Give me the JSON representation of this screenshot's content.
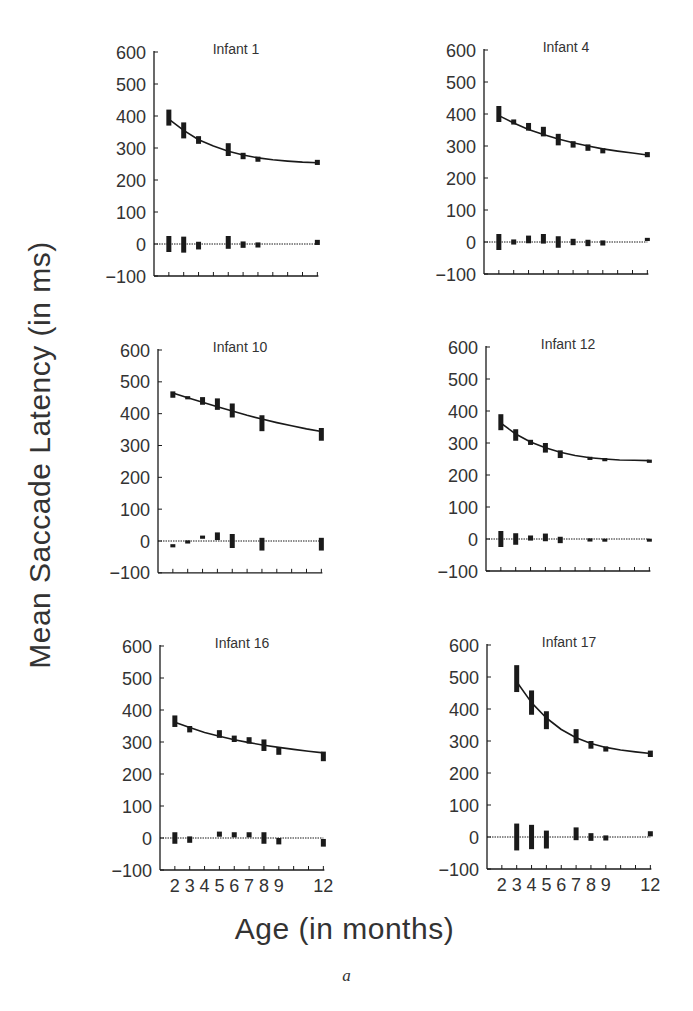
{
  "figure": {
    "ylabel": "Mean Saccade Latency (in ms)",
    "xlabel": "Age (in months)",
    "caption": "a"
  },
  "chart_data": [
    {
      "type": "line",
      "title": "Infant 1",
      "xlabel": "Age (in months)",
      "ylabel": "Mean Saccade Latency (in ms)",
      "ylim": [
        -100,
        600
      ],
      "yticks": [
        -100,
        0,
        100,
        200,
        300,
        400,
        500,
        600
      ],
      "xlim": [
        1,
        12
      ],
      "xticks": [
        2,
        3,
        4,
        5,
        6,
        7,
        8,
        9,
        10,
        11,
        12
      ],
      "xtick_labels_shown": false,
      "series": [
        {
          "name": "Observed mean latency (error bars)",
          "x": [
            2,
            3,
            4,
            6,
            7,
            8,
            12
          ],
          "values": [
            395,
            355,
            325,
            295,
            275,
            265,
            255
          ],
          "err": [
            25,
            25,
            12,
            20,
            10,
            8,
            8
          ]
        },
        {
          "name": "Fitted curve",
          "x": [
            2,
            3,
            4,
            5,
            6,
            7,
            8,
            9,
            10,
            11,
            12
          ],
          "values": [
            390,
            355,
            326,
            306,
            290,
            278,
            269,
            263,
            259,
            256,
            254
          ]
        },
        {
          "name": "Residuals",
          "x": [
            2,
            3,
            4,
            6,
            7,
            8,
            12
          ],
          "values": [
            0,
            -2,
            -5,
            5,
            -2,
            -3,
            5
          ],
          "err": [
            25,
            25,
            12,
            20,
            10,
            8,
            8
          ]
        }
      ]
    },
    {
      "type": "line",
      "title": "Infant 4",
      "xlabel": "Age (in months)",
      "ylabel": "Mean Saccade Latency (in ms)",
      "ylim": [
        -100,
        600
      ],
      "yticks": [
        -100,
        0,
        100,
        200,
        300,
        400,
        500,
        600
      ],
      "xlim": [
        1,
        12
      ],
      "xticks": [
        2,
        3,
        4,
        5,
        6,
        7,
        8,
        9,
        10,
        11,
        12
      ],
      "xtick_labels_shown": false,
      "series": [
        {
          "name": "Observed mean latency (error bars)",
          "x": [
            2,
            3,
            4,
            5,
            6,
            7,
            8,
            9,
            12
          ],
          "values": [
            400,
            375,
            360,
            345,
            320,
            305,
            295,
            285,
            273
          ],
          "err": [
            25,
            8,
            12,
            15,
            18,
            10,
            10,
            8,
            8
          ]
        },
        {
          "name": "Fitted curve",
          "x": [
            2,
            3,
            4,
            5,
            6,
            7,
            8,
            9,
            10,
            11,
            12
          ],
          "values": [
            395,
            372,
            352,
            336,
            322,
            310,
            300,
            291,
            284,
            278,
            272
          ]
        },
        {
          "name": "Residuals",
          "x": [
            2,
            3,
            4,
            5,
            6,
            7,
            8,
            9,
            12
          ],
          "values": [
            0,
            0,
            8,
            10,
            0,
            0,
            -3,
            -3,
            8
          ],
          "err": [
            25,
            8,
            12,
            15,
            18,
            10,
            10,
            8,
            5
          ]
        }
      ]
    },
    {
      "type": "line",
      "title": "Infant 10",
      "xlabel": "Age (in months)",
      "ylabel": "Mean Saccade Latency (in ms)",
      "ylim": [
        -100,
        600
      ],
      "yticks": [
        -100,
        0,
        100,
        200,
        300,
        400,
        500,
        600
      ],
      "xlim": [
        1,
        12
      ],
      "xticks": [
        2,
        3,
        4,
        5,
        6,
        7,
        8,
        9,
        10,
        11,
        12
      ],
      "xtick_labels_shown": false,
      "series": [
        {
          "name": "Observed mean latency (error bars)",
          "x": [
            2,
            3,
            4,
            5,
            6,
            8,
            12
          ],
          "values": [
            460,
            450,
            440,
            430,
            410,
            370,
            335
          ],
          "err": [
            10,
            5,
            12,
            18,
            22,
            25,
            20
          ]
        },
        {
          "name": "Fitted curve",
          "x": [
            2,
            3,
            4,
            5,
            6,
            7,
            8,
            9,
            10,
            11,
            12
          ],
          "values": [
            465,
            450,
            436,
            422,
            408,
            395,
            383,
            372,
            362,
            352,
            344
          ]
        },
        {
          "name": "Residuals",
          "x": [
            2,
            3,
            4,
            5,
            6,
            8,
            12
          ],
          "values": [
            -15,
            -3,
            12,
            15,
            0,
            -10,
            -10
          ],
          "err": [
            5,
            5,
            5,
            12,
            22,
            20,
            20
          ]
        }
      ]
    },
    {
      "type": "line",
      "title": "Infant 12",
      "xlabel": "Age (in months)",
      "ylabel": "Mean Saccade Latency (in ms)",
      "ylim": [
        -100,
        600
      ],
      "yticks": [
        -100,
        0,
        100,
        200,
        300,
        400,
        500,
        600
      ],
      "xlim": [
        1,
        12
      ],
      "xticks": [
        2,
        3,
        4,
        5,
        6,
        7,
        8,
        9,
        10,
        11,
        12
      ],
      "xtick_labels_shown": false,
      "series": [
        {
          "name": "Observed mean latency (error bars)",
          "x": [
            2,
            3,
            4,
            5,
            6,
            8,
            9,
            12
          ],
          "values": [
            365,
            325,
            302,
            285,
            265,
            252,
            248,
            243
          ],
          "err": [
            25,
            18,
            8,
            15,
            12,
            5,
            5,
            5
          ]
        },
        {
          "name": "Fitted curve",
          "x": [
            2,
            3,
            4,
            5,
            6,
            7,
            8,
            9,
            10,
            11,
            12
          ],
          "values": [
            362,
            328,
            303,
            285,
            271,
            261,
            254,
            250,
            247,
            246,
            245
          ]
        },
        {
          "name": "Residuals",
          "x": [
            2,
            3,
            4,
            5,
            6,
            8,
            9,
            12
          ],
          "values": [
            0,
            0,
            3,
            5,
            -3,
            -3,
            -2,
            -2
          ],
          "err": [
            25,
            18,
            8,
            12,
            10,
            5,
            3,
            3
          ]
        }
      ]
    },
    {
      "type": "line",
      "title": "Infant 16",
      "xlabel": "Age (in months)",
      "ylabel": "Mean Saccade Latency (in ms)",
      "ylim": [
        -100,
        600
      ],
      "yticks": [
        -100,
        0,
        100,
        200,
        300,
        400,
        500,
        600
      ],
      "xlim": [
        1,
        12
      ],
      "xticks": [
        2,
        3,
        4,
        5,
        6,
        7,
        8,
        9,
        10,
        11,
        12
      ],
      "xtick_labels": [
        "2",
        "3",
        "4",
        "5",
        "6",
        "7",
        "8",
        "9",
        "12"
      ],
      "xtick_labels_shown": true,
      "series": [
        {
          "name": "Observed mean latency (error bars)",
          "x": [
            2,
            3,
            5,
            6,
            7,
            8,
            9,
            12
          ],
          "values": [
            365,
            340,
            325,
            310,
            305,
            290,
            272,
            255
          ],
          "err": [
            18,
            10,
            12,
            10,
            10,
            18,
            12,
            15
          ]
        },
        {
          "name": "Fitted curve",
          "x": [
            2,
            3,
            4,
            5,
            6,
            7,
            8,
            9,
            10,
            11,
            12
          ],
          "values": [
            362,
            345,
            330,
            318,
            307,
            298,
            290,
            283,
            277,
            271,
            266
          ]
        },
        {
          "name": "Residuals",
          "x": [
            2,
            3,
            5,
            6,
            7,
            8,
            9,
            12
          ],
          "values": [
            0,
            -5,
            12,
            10,
            10,
            0,
            -10,
            -15
          ],
          "err": [
            18,
            10,
            8,
            8,
            8,
            18,
            10,
            12
          ]
        }
      ]
    },
    {
      "type": "line",
      "title": "Infant 17",
      "xlabel": "Age (in months)",
      "ylabel": "Mean Saccade Latency (in ms)",
      "ylim": [
        -100,
        600
      ],
      "yticks": [
        -100,
        0,
        100,
        200,
        300,
        400,
        500,
        600
      ],
      "xlim": [
        1,
        12
      ],
      "xticks": [
        2,
        3,
        4,
        5,
        6,
        7,
        8,
        9,
        10,
        11,
        12
      ],
      "xtick_labels": [
        "2",
        "3",
        "4",
        "5",
        "6",
        "7",
        "8",
        "9",
        "12"
      ],
      "xtick_labels_shown": true,
      "series": [
        {
          "name": "Observed mean latency (error bars)",
          "x": [
            3,
            4,
            5,
            7,
            8,
            9,
            12
          ],
          "values": [
            495,
            420,
            365,
            315,
            288,
            275,
            260
          ],
          "err": [
            42,
            38,
            28,
            22,
            12,
            8,
            10
          ]
        },
        {
          "name": "Fitted curve",
          "x": [
            3,
            4,
            5,
            6,
            7,
            8,
            9,
            10,
            11,
            12
          ],
          "values": [
            485,
            420,
            372,
            336,
            310,
            292,
            280,
            272,
            266,
            261
          ]
        },
        {
          "name": "Residuals",
          "x": [
            3,
            4,
            5,
            7,
            8,
            9,
            12
          ],
          "values": [
            0,
            0,
            -8,
            10,
            0,
            -3,
            10
          ],
          "err": [
            42,
            38,
            28,
            20,
            12,
            8,
            8
          ]
        }
      ]
    }
  ],
  "layout": {
    "panels": [
      {
        "axis_x": 154,
        "zero_y": 244,
        "top_y": 52
      },
      {
        "axis_x": 484,
        "zero_y": 242,
        "top_y": 50
      },
      {
        "axis_x": 158,
        "zero_y": 541,
        "top_y": 350
      },
      {
        "axis_x": 486,
        "zero_y": 539,
        "top_y": 347
      },
      {
        "axis_x": 160,
        "zero_y": 838,
        "top_y": 646
      },
      {
        "axis_x": 487,
        "zero_y": 837,
        "top_y": 645
      }
    ],
    "month_px": 14.85,
    "ink": "#1a1a1a"
  }
}
